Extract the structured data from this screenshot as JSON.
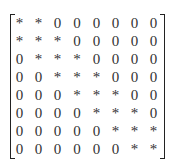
{
  "matrix": {
    "rows": [
      [
        "*",
        "*",
        "0",
        "0",
        "0",
        "0",
        "0",
        "0"
      ],
      [
        "*",
        "*",
        "*",
        "0",
        "0",
        "0",
        "0",
        "0"
      ],
      [
        "0",
        "*",
        "*",
        "*",
        "0",
        "0",
        "0",
        "0"
      ],
      [
        "0",
        "0",
        "*",
        "*",
        "*",
        "0",
        "0",
        "0"
      ],
      [
        "0",
        "0",
        "0",
        "*",
        "*",
        "*",
        "0",
        "0"
      ],
      [
        "0",
        "0",
        "0",
        "0",
        "*",
        "*",
        "*",
        "0"
      ],
      [
        "0",
        "0",
        "0",
        "0",
        "0",
        "*",
        "*",
        "*"
      ],
      [
        "0",
        "0",
        "0",
        "0",
        "0",
        "0",
        "*",
        "*"
      ]
    ]
  }
}
